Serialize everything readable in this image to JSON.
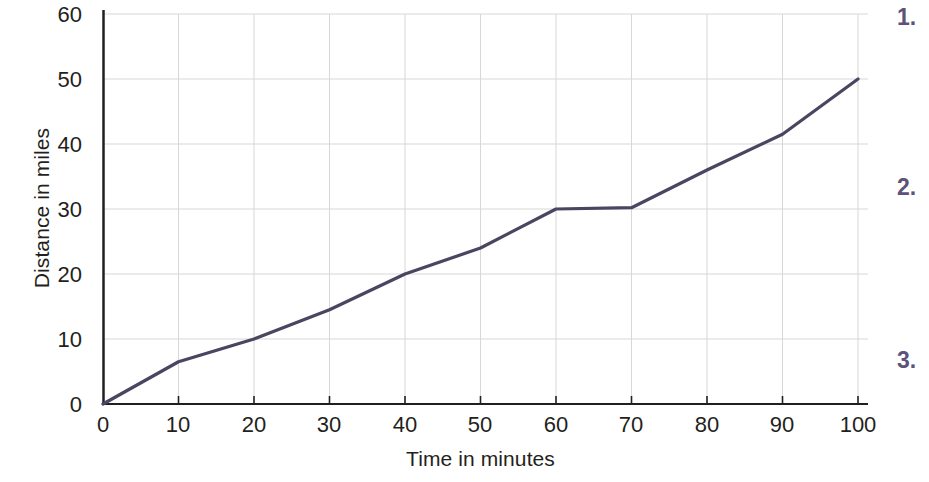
{
  "chart_data": {
    "type": "line",
    "title": "",
    "xlabel": "Time in minutes",
    "ylabel": "Distance in miles",
    "xlim": [
      0,
      100
    ],
    "ylim": [
      0,
      60
    ],
    "xticks": [
      "0",
      "10",
      "20",
      "30",
      "40",
      "50",
      "60",
      "70",
      "80",
      "90",
      "100"
    ],
    "yticks": [
      "0",
      "10",
      "20",
      "30",
      "40",
      "50",
      "60"
    ],
    "grid": true,
    "legend": "none",
    "series": [
      {
        "name": "Distance travelled",
        "color": "#4a4560",
        "x": [
          0,
          10,
          20,
          30,
          40,
          50,
          60,
          70,
          80,
          90,
          100
        ],
        "values": [
          0,
          6.5,
          10,
          14.5,
          20,
          24,
          30,
          30.2,
          36,
          41.5,
          50
        ]
      }
    ]
  },
  "questions": {
    "items": [
      {
        "marker": "1."
      },
      {
        "marker": "2."
      },
      {
        "marker": "3."
      }
    ]
  }
}
